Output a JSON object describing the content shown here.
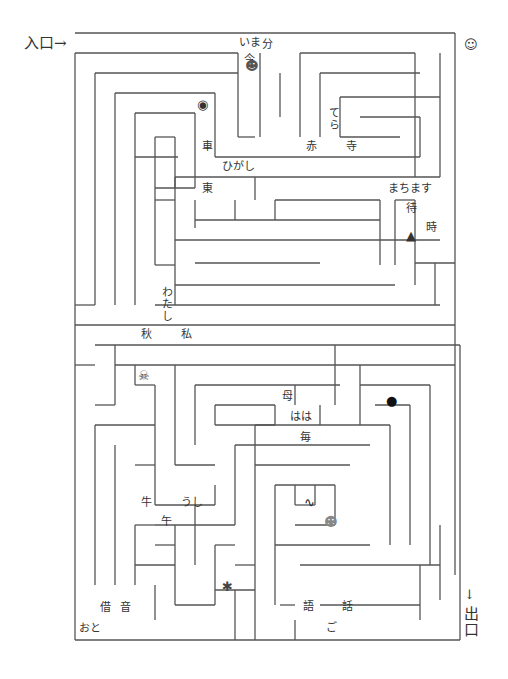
{
  "entrance": {
    "label": "入口→",
    "x": 24,
    "y": 36
  },
  "exit": {
    "arrow": "↓",
    "label": "出口",
    "x": 462,
    "y": 588
  },
  "colors": {
    "wall": "#555555",
    "text": "#333333"
  },
  "labels": [
    {
      "text": "いま",
      "x": 239,
      "y": 37
    },
    {
      "text": "分",
      "x": 262,
      "y": 39
    },
    {
      "text": "今",
      "x": 244,
      "y": 54
    },
    {
      "text": "てら",
      "x": 328,
      "y": 107,
      "vertical": true
    },
    {
      "text": "車",
      "x": 202,
      "y": 141
    },
    {
      "text": "赤",
      "x": 306,
      "y": 141
    },
    {
      "text": "寺",
      "x": 346,
      "y": 141
    },
    {
      "text": "ひがし",
      "x": 222,
      "y": 161
    },
    {
      "text": "東",
      "x": 202,
      "y": 183
    },
    {
      "text": "まちます",
      "x": 388,
      "y": 183
    },
    {
      "text": "待",
      "x": 406,
      "y": 203
    },
    {
      "text": "時",
      "x": 426,
      "y": 222
    },
    {
      "text": "わたし",
      "x": 161,
      "y": 286,
      "vertical": true
    },
    {
      "text": "秋",
      "x": 141,
      "y": 329
    },
    {
      "text": "私",
      "x": 181,
      "y": 329
    },
    {
      "text": "母",
      "x": 282,
      "y": 391
    },
    {
      "text": "はは",
      "x": 290,
      "y": 411
    },
    {
      "text": "毎",
      "x": 300,
      "y": 432
    },
    {
      "text": "牛",
      "x": 141,
      "y": 497
    },
    {
      "text": "うし",
      "x": 181,
      "y": 497
    },
    {
      "text": "午",
      "x": 161,
      "y": 516
    },
    {
      "text": "借",
      "x": 100,
      "y": 602
    },
    {
      "text": "音",
      "x": 120,
      "y": 602
    },
    {
      "text": "語",
      "x": 303,
      "y": 601
    },
    {
      "text": "話",
      "x": 342,
      "y": 601
    },
    {
      "text": "ご",
      "x": 326,
      "y": 622
    },
    {
      "text": "おと",
      "x": 79,
      "y": 623
    }
  ],
  "icons": [
    {
      "name": "demon-face-icon",
      "glyph": "☻",
      "x": 245,
      "y": 59,
      "color": "#555"
    },
    {
      "name": "old-woman-icon",
      "glyph": "☺",
      "x": 464,
      "y": 38,
      "color": "#333"
    },
    {
      "name": "eye-creature-icon",
      "glyph": "◉",
      "x": 197,
      "y": 98,
      "color": "#333"
    },
    {
      "name": "umbrella-ghost-icon",
      "glyph": "▲",
      "x": 406,
      "y": 229,
      "color": "#333"
    },
    {
      "name": "skull-crossbones-icon",
      "glyph": "☠",
      "x": 138,
      "y": 369,
      "color": "#444"
    },
    {
      "name": "bomb-icon",
      "glyph": "●",
      "x": 386,
      "y": 394,
      "color": "#111"
    },
    {
      "name": "snake-icon",
      "glyph": "∿",
      "x": 304,
      "y": 496,
      "color": "#222"
    },
    {
      "name": "monster-face-icon",
      "glyph": "☻",
      "x": 324,
      "y": 515,
      "color": "#888"
    },
    {
      "name": "lantern-ghost-icon",
      "glyph": "✱",
      "x": 222,
      "y": 580,
      "color": "#444"
    }
  ],
  "walls": [
    [
      75,
      33,
      455,
      33
    ],
    [
      455,
      33,
      455,
      575
    ],
    [
      75,
      53,
      75,
      640
    ],
    [
      75,
      53,
      238,
      53
    ],
    [
      238,
      53,
      238,
      137
    ],
    [
      238,
      137,
      255,
      137
    ],
    [
      95,
      73,
      95,
      305
    ],
    [
      95,
      73,
      238,
      73
    ],
    [
      115,
      93,
      115,
      305
    ],
    [
      115,
      93,
      215,
      93
    ],
    [
      215,
      93,
      215,
      157
    ],
    [
      215,
      157,
      255,
      157
    ],
    [
      135,
      113,
      135,
      285
    ],
    [
      135,
      113,
      195,
      113
    ],
    [
      195,
      113,
      195,
      188
    ],
    [
      155,
      137,
      175,
      137
    ],
    [
      175,
      137,
      175,
      188
    ],
    [
      135,
      157,
      178,
      157
    ],
    [
      155,
      137,
      155,
      265
    ],
    [
      155,
      188,
      195,
      188
    ],
    [
      260,
      53,
      260,
      137
    ],
    [
      280,
      73,
      280,
      117
    ],
    [
      300,
      53,
      300,
      137
    ],
    [
      320,
      73,
      320,
      137
    ],
    [
      320,
      73,
      420,
      73
    ],
    [
      340,
      97,
      340,
      137
    ],
    [
      340,
      97,
      440,
      97
    ],
    [
      360,
      117,
      420,
      117
    ],
    [
      420,
      117,
      420,
      157
    ],
    [
      255,
      157,
      420,
      157
    ],
    [
      340,
      137,
      400,
      137
    ],
    [
      440,
      53,
      440,
      177
    ],
    [
      415,
      53,
      415,
      177
    ],
    [
      300,
      53,
      415,
      53
    ],
    [
      175,
      177,
      440,
      177
    ],
    [
      175,
      177,
      175,
      200
    ],
    [
      155,
      200,
      175,
      200
    ],
    [
      175,
      200,
      175,
      265
    ],
    [
      195,
      200,
      195,
      228
    ],
    [
      235,
      200,
      235,
      220
    ],
    [
      255,
      177,
      255,
      200
    ],
    [
      275,
      200,
      380,
      200
    ],
    [
      275,
      200,
      275,
      220
    ],
    [
      195,
      220,
      380,
      220
    ],
    [
      380,
      200,
      380,
      265
    ],
    [
      175,
      240,
      440,
      240
    ],
    [
      195,
      263,
      320,
      263
    ],
    [
      155,
      265,
      175,
      265
    ],
    [
      175,
      265,
      175,
      285
    ],
    [
      175,
      285,
      395,
      285
    ],
    [
      395,
      200,
      395,
      265
    ],
    [
      415,
      200,
      415,
      285
    ],
    [
      395,
      200,
      415,
      200
    ],
    [
      415,
      263,
      455,
      263
    ],
    [
      435,
      263,
      435,
      305
    ],
    [
      155,
      305,
      440,
      305
    ],
    [
      135,
      285,
      135,
      305
    ],
    [
      75,
      305,
      95,
      305
    ],
    [
      175,
      285,
      175,
      305
    ],
    [
      75,
      325,
      455,
      325
    ],
    [
      95,
      345,
      460,
      345
    ],
    [
      115,
      345,
      115,
      405
    ],
    [
      75,
      365,
      95,
      365
    ],
    [
      95,
      405,
      115,
      405
    ],
    [
      115,
      365,
      455,
      365
    ],
    [
      135,
      365,
      135,
      385
    ],
    [
      135,
      385,
      155,
      385
    ],
    [
      155,
      385,
      155,
      445
    ],
    [
      175,
      365,
      175,
      465
    ],
    [
      175,
      465,
      215,
      465
    ],
    [
      195,
      385,
      340,
      385
    ],
    [
      195,
      385,
      195,
      445
    ],
    [
      215,
      405,
      275,
      405
    ],
    [
      215,
      405,
      215,
      425
    ],
    [
      215,
      425,
      275,
      425
    ],
    [
      275,
      405,
      275,
      425
    ],
    [
      295,
      385,
      295,
      405
    ],
    [
      320,
      405,
      320,
      425
    ],
    [
      335,
      345,
      335,
      405
    ],
    [
      360,
      365,
      360,
      425
    ],
    [
      360,
      385,
      430,
      385
    ],
    [
      430,
      385,
      430,
      565
    ],
    [
      375,
      405,
      410,
      405
    ],
    [
      375,
      405,
      375,
      405
    ],
    [
      410,
      405,
      410,
      545
    ],
    [
      255,
      425,
      390,
      425
    ],
    [
      255,
      425,
      255,
      565
    ],
    [
      390,
      425,
      390,
      545
    ],
    [
      235,
      445,
      370,
      445
    ],
    [
      235,
      445,
      235,
      525
    ],
    [
      135,
      465,
      155,
      465
    ],
    [
      255,
      465,
      350,
      465
    ],
    [
      255,
      465,
      255,
      465
    ],
    [
      275,
      485,
      335,
      485
    ],
    [
      275,
      485,
      275,
      545
    ],
    [
      295,
      485,
      295,
      505
    ],
    [
      295,
      505,
      315,
      505
    ],
    [
      315,
      485,
      315,
      505
    ],
    [
      335,
      485,
      335,
      525
    ],
    [
      295,
      525,
      335,
      525
    ],
    [
      95,
      425,
      95,
      585
    ],
    [
      95,
      425,
      155,
      425
    ],
    [
      115,
      445,
      115,
      585
    ],
    [
      135,
      445,
      135,
      445
    ],
    [
      155,
      445,
      155,
      505
    ],
    [
      155,
      505,
      215,
      505
    ],
    [
      195,
      505,
      195,
      565
    ],
    [
      215,
      485,
      215,
      505
    ],
    [
      135,
      525,
      155,
      525
    ],
    [
      135,
      525,
      135,
      585
    ],
    [
      155,
      545,
      175,
      545
    ],
    [
      155,
      525,
      235,
      525
    ],
    [
      175,
      525,
      175,
      565
    ],
    [
      135,
      565,
      175,
      565
    ],
    [
      175,
      565,
      175,
      605
    ],
    [
      175,
      605,
      215,
      605
    ],
    [
      155,
      585,
      155,
      620
    ],
    [
      215,
      545,
      235,
      545
    ],
    [
      215,
      545,
      215,
      605
    ],
    [
      235,
      565,
      255,
      565
    ],
    [
      255,
      565,
      255,
      605
    ],
    [
      215,
      590,
      255,
      590
    ],
    [
      235,
      590,
      235,
      620
    ],
    [
      275,
      545,
      370,
      545
    ],
    [
      275,
      545,
      275,
      605
    ],
    [
      300,
      565,
      440,
      565
    ],
    [
      295,
      605,
      280,
      605
    ],
    [
      320,
      605,
      420,
      605
    ],
    [
      420,
      565,
      420,
      620
    ],
    [
      440,
      525,
      440,
      600
    ],
    [
      460,
      345,
      460,
      640
    ],
    [
      75,
      640,
      460,
      640
    ],
    [
      255,
      605,
      255,
      640
    ],
    [
      295,
      620,
      295,
      640
    ],
    [
      235,
      620,
      235,
      640
    ]
  ]
}
